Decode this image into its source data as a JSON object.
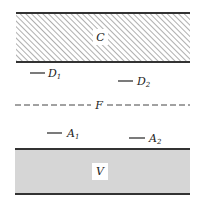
{
  "diagram": {
    "bands": [
      {
        "id": "C",
        "label": "C",
        "fill": "hatched",
        "top": 13,
        "bottom": 62
      },
      {
        "id": "V",
        "label": "V",
        "fill": "#d6d6d6",
        "top": 149,
        "bottom": 194
      }
    ],
    "fermi_line": {
      "label": "F",
      "y": 105,
      "style": "dashed"
    },
    "levels": [
      {
        "id": "D1",
        "letter": "D",
        "sub": "1",
        "x1": 30,
        "x2": 45,
        "y": 73
      },
      {
        "id": "D2",
        "letter": "D",
        "sub": "2",
        "x1": 118,
        "x2": 133,
        "y": 81
      },
      {
        "id": "A1",
        "letter": "A",
        "sub": "1",
        "x1": 47,
        "x2": 62,
        "y": 133
      },
      {
        "id": "A2",
        "letter": "A",
        "sub": "2",
        "x1": 129,
        "x2": 145,
        "y": 138
      }
    ],
    "colors": {
      "line": "#333333",
      "hatch": "#9a9a9a",
      "valence_fill": "#d6d6d6"
    }
  }
}
